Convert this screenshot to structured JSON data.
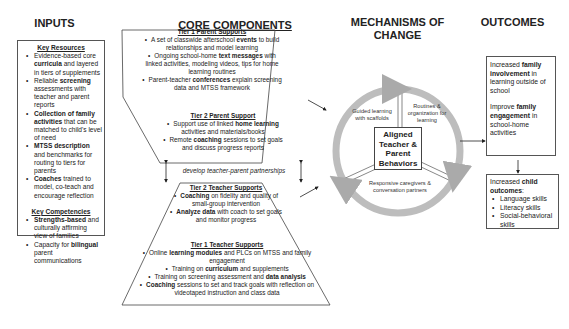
{
  "columns": {
    "inputs": "INPUTS",
    "core": "CORE COMPONENTS",
    "mechanisms": "MECHANISMS OF CHANGE",
    "outcomes": "OUTCOMES"
  },
  "inputs": {
    "key_resources_title": "Key Resources",
    "resources": [
      {
        "pre": "Evidence-based core ",
        "bold": "curricula",
        "post": " and layered in tiers of supplements"
      },
      {
        "pre": "Reliable ",
        "bold": "screening",
        "post": " assessments with teacher and parent reports"
      },
      {
        "pre": "",
        "bold": "Collection of family activities",
        "post": " that can be matched to child's level of need"
      },
      {
        "pre": "",
        "bold": "MTSS description",
        "post": " and benchmarks for routing to tiers for parents"
      },
      {
        "pre": "",
        "bold": "Coaches",
        "post": " trained to model, co-teach and encourage reflection"
      }
    ],
    "key_competencies_title": "Key Competencies",
    "competencies": [
      {
        "pre": "",
        "bold": "Strengths-based",
        "post": " and culturally affirming view of families"
      },
      {
        "pre": "Capacity for ",
        "bold": "bilingual",
        "post": " parent communications"
      }
    ]
  },
  "core": {
    "tier1_parent": {
      "title": "Tier 1 Parent Supports",
      "items": [
        {
          "pre": "A set of classwide afterschool ",
          "bold": "events",
          "post": " to build relationships and model learning"
        },
        {
          "pre": "Ongoing school-home ",
          "bold": "text messages",
          "post": " with linked activities, modeling videos, tips for home learning routines"
        },
        {
          "pre": "Parent-teacher ",
          "bold": "conferences",
          "post": " explain screening data and MTSS framework"
        }
      ]
    },
    "tier2_parent": {
      "title": "Tier 2 Parent Support",
      "items": [
        {
          "pre": "Support use of linked ",
          "bold": "home learning",
          "post": " activities and materials/books"
        },
        {
          "pre": "Remote ",
          "bold": "coaching",
          "post": " sessions to set goals and discuss progress reports"
        }
      ]
    },
    "partnership": "develop teacher-parent partnerships",
    "tier2_teacher": {
      "title": "Tier 2 Teacher Supports",
      "items": [
        {
          "pre": "",
          "bold": "Coaching",
          "post": " on fidelity and quality of small-group intervention"
        },
        {
          "pre": "",
          "bold": "Analyze data",
          "post": " with coach to set goals and monitor progress"
        }
      ]
    },
    "tier1_teacher": {
      "title": "Tier 1 Teacher Supports",
      "items": [
        {
          "pre": "Online ",
          "bold": "learning modules",
          "post": " and PLCs on MTSS and family engagement"
        },
        {
          "pre": "Training on ",
          "bold": "curriculum",
          "post": " and supplements"
        },
        {
          "pre": "Training on screening assessment and ",
          "bold": "data analysis",
          "post": ""
        },
        {
          "pre": "",
          "bold": "Coaching",
          "post": " sessions to set and track goals with reflection on videotaped instruction and class data"
        }
      ]
    }
  },
  "mechanisms": {
    "center": "Aligned Teacher & Parent Behaviors",
    "segments": [
      "Guided learning with scaffolds",
      "Routines & organization for learning",
      "Responsive caregivers & conversation partners"
    ]
  },
  "outcomes": {
    "box1": [
      {
        "pre": "Increased ",
        "bold": "family involvement",
        "post": " in learning outside of school"
      },
      {
        "pre": "Improve ",
        "bold": "family engagement",
        "post": " in school-home activities"
      }
    ],
    "box2": {
      "pre": "Increased ",
      "bold": "child outcomes",
      "post": ":",
      "items": [
        "Language skills",
        "Literacy skills",
        "Social-behavioral skills"
      ]
    }
  }
}
